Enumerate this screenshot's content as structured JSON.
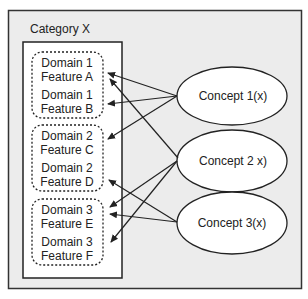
{
  "category": {
    "title": "Category X"
  },
  "domains": [
    {
      "id": "d1",
      "features": [
        {
          "id": "A",
          "line1": "Domain 1",
          "line2": "Feature A"
        },
        {
          "id": "B",
          "line1": "Domain 1",
          "line2": "Feature B"
        }
      ]
    },
    {
      "id": "d2",
      "features": [
        {
          "id": "C",
          "line1": "Domain 2",
          "line2": "Feature C"
        },
        {
          "id": "D",
          "line1": "Domain 2",
          "line2": "Feature D"
        }
      ]
    },
    {
      "id": "d3",
      "features": [
        {
          "id": "E",
          "line1": "Domain 3",
          "line2": "Feature E"
        },
        {
          "id": "F",
          "line1": "Domain 3",
          "line2": "Feature F"
        }
      ]
    }
  ],
  "concepts": [
    {
      "id": "c1",
      "label": "Concept 1(x)"
    },
    {
      "id": "c2",
      "label": "Concept 2 x)"
    },
    {
      "id": "c3",
      "label": "Concept 3(x)"
    }
  ],
  "edges": [
    {
      "from": "Concept 1(x)",
      "to": "Feature A"
    },
    {
      "from": "Concept 1(x)",
      "to": "Feature B"
    },
    {
      "from": "Concept 1(x)",
      "to": "Feature C"
    },
    {
      "from": "Concept 2 x)",
      "to": "Feature A"
    },
    {
      "from": "Concept 2 x)",
      "to": "Feature E"
    },
    {
      "from": "Concept 2 x)",
      "to": "Feature F"
    },
    {
      "from": "Concept 3(x)",
      "to": "Feature D"
    },
    {
      "from": "Concept 3(x)",
      "to": "Feature E"
    }
  ],
  "colors": {
    "background": "#ececec",
    "stroke": "#222222",
    "fill": "#ffffff"
  }
}
